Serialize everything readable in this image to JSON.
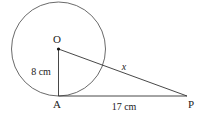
{
  "diagram": {
    "points": {
      "center": {
        "label": "O"
      },
      "tangent_point": {
        "label": "A"
      },
      "external_point": {
        "label": "P"
      }
    },
    "segments": {
      "OA": {
        "label": "8 cm",
        "value": 8,
        "unit": "cm"
      },
      "AP": {
        "label": "17 cm",
        "value": 17,
        "unit": "cm"
      },
      "OP": {
        "label": "x"
      }
    },
    "colors": {
      "stroke": "#333333",
      "text": "#222222",
      "background": "#ffffff"
    }
  }
}
